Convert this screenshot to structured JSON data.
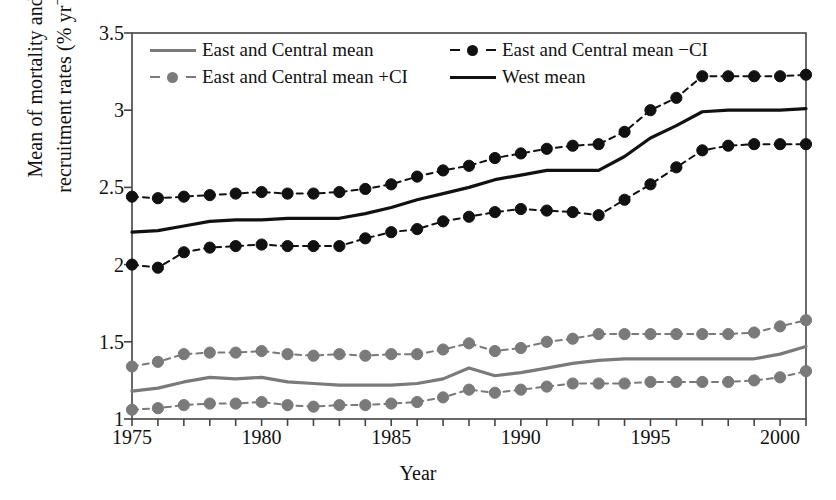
{
  "chart_data": {
    "type": "line",
    "title": "",
    "xlabel": "Year",
    "ylabel": "Mean of mortality and recruitment rates (% yr−1)",
    "ylabel_line1": "Mean of mortality and",
    "ylabel_line2": "recruitment rates (% yr",
    "ylabel_exponent": "−1",
    "ylabel_close": ")",
    "xlim": [
      1975,
      2001
    ],
    "ylim": [
      1,
      3.5
    ],
    "xticks": [
      1975,
      1976,
      1977,
      1978,
      1979,
      1980,
      1981,
      1982,
      1983,
      1984,
      1985,
      1986,
      1987,
      1988,
      1989,
      1990,
      1991,
      1992,
      1993,
      1994,
      1995,
      1996,
      1997,
      1998,
      1999,
      2000,
      2001
    ],
    "xtick_labels": [
      {
        "value": 1975,
        "label": "1975"
      },
      {
        "value": 1980,
        "label": "1980"
      },
      {
        "value": 1985,
        "label": "1985"
      },
      {
        "value": 1990,
        "label": "1990"
      },
      {
        "value": 1995,
        "label": "1995"
      },
      {
        "value": 2000,
        "label": "2000"
      }
    ],
    "yticks": [
      1,
      1.5,
      2,
      2.5,
      3,
      3.5
    ],
    "ytick_labels": [
      "1",
      "1.5",
      "2",
      "2.5",
      "3",
      "3.5"
    ],
    "grid": false,
    "legend_position": "top-inside",
    "colors": {
      "black": "#111111",
      "gray": "#7a7a7a",
      "axis": "#444444"
    },
    "x": [
      1975,
      1976,
      1977,
      1978,
      1979,
      1980,
      1981,
      1982,
      1983,
      1984,
      1985,
      1986,
      1987,
      1988,
      1989,
      1990,
      1991,
      1992,
      1993,
      1994,
      1995,
      1996,
      1997,
      1998,
      1999,
      2000,
      2001
    ],
    "series": [
      {
        "name": "East and Central mean",
        "style": "solid",
        "color": "#7a7a7a",
        "marker": "none",
        "values": [
          1.18,
          1.2,
          1.24,
          1.27,
          1.26,
          1.27,
          1.24,
          1.23,
          1.22,
          1.22,
          1.22,
          1.23,
          1.26,
          1.33,
          1.28,
          1.3,
          1.33,
          1.36,
          1.38,
          1.39,
          1.39,
          1.39,
          1.39,
          1.39,
          1.39,
          1.42,
          1.47
        ]
      },
      {
        "name": "East and Central mean +CI",
        "style": "dashed",
        "color": "#7a7a7a",
        "marker": "circle",
        "values": [
          1.34,
          1.37,
          1.42,
          1.43,
          1.43,
          1.44,
          1.42,
          1.41,
          1.42,
          1.41,
          1.42,
          1.42,
          1.45,
          1.49,
          1.44,
          1.46,
          1.5,
          1.52,
          1.55,
          1.55,
          1.55,
          1.55,
          1.55,
          1.55,
          1.56,
          1.6,
          1.64
        ]
      },
      {
        "name": "East and Central mean −CI",
        "style": "dashed",
        "color": "#111111",
        "marker": "circle",
        "values": [
          2.44,
          2.43,
          2.44,
          2.45,
          2.46,
          2.47,
          2.46,
          2.46,
          2.47,
          2.49,
          2.52,
          2.57,
          2.61,
          2.64,
          2.69,
          2.72,
          2.75,
          2.77,
          2.78,
          2.86,
          3.0,
          3.08,
          3.22,
          3.22,
          3.22,
          3.22,
          3.23
        ]
      },
      {
        "name": "West mean",
        "style": "solid",
        "color": "#111111",
        "marker": "none",
        "values": [
          2.21,
          2.22,
          2.25,
          2.28,
          2.29,
          2.29,
          2.3,
          2.3,
          2.3,
          2.33,
          2.37,
          2.42,
          2.46,
          2.5,
          2.55,
          2.58,
          2.61,
          2.61,
          2.61,
          2.7,
          2.82,
          2.9,
          2.99,
          3.0,
          3.0,
          3.0,
          3.01
        ]
      },
      {
        "name": "East and Central lower CI (black)",
        "style": "dashed",
        "color": "#111111",
        "marker": "circle",
        "values": [
          2.0,
          1.98,
          2.08,
          2.11,
          2.12,
          2.13,
          2.12,
          2.12,
          2.12,
          2.17,
          2.21,
          2.23,
          2.28,
          2.31,
          2.34,
          2.36,
          2.35,
          2.34,
          2.32,
          2.42,
          2.52,
          2.63,
          2.74,
          2.77,
          2.78,
          2.78,
          2.78
        ]
      },
      {
        "name": "East and Central lower CI (gray)",
        "style": "dashed",
        "color": "#7a7a7a",
        "marker": "circle",
        "values": [
          1.06,
          1.07,
          1.09,
          1.1,
          1.1,
          1.11,
          1.09,
          1.08,
          1.09,
          1.09,
          1.1,
          1.11,
          1.14,
          1.19,
          1.17,
          1.19,
          1.21,
          1.23,
          1.23,
          1.23,
          1.24,
          1.24,
          1.24,
          1.24,
          1.25,
          1.27,
          1.31
        ]
      }
    ]
  },
  "legend": {
    "rows": [
      [
        {
          "label": "East and Central mean",
          "key": "solid",
          "color": "#7a7a7a",
          "marker": "none"
        },
        {
          "label": "East and Central mean −CI",
          "key": "dashed",
          "color": "#111111",
          "marker": "circle"
        }
      ],
      [
        {
          "label": "East and Central mean +CI",
          "key": "dashed",
          "color": "#7a7a7a",
          "marker": "circle"
        },
        {
          "label": "West mean",
          "key": "solid",
          "color": "#111111",
          "marker": "none"
        }
      ]
    ]
  }
}
